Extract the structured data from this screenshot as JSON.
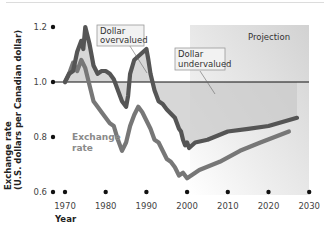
{
  "chart_data": {
    "type": "line",
    "title": "",
    "xlabel": "Year",
    "ylabel": "Exchange rate (U.S. dollars per Canadian dollar)",
    "xlim": [
      1967,
      2030
    ],
    "ylim": [
      0.6,
      1.2
    ],
    "x_ticks": [
      "1970",
      "1980",
      "1990",
      "2000",
      "2010",
      "2020",
      "2030"
    ],
    "y_ticks": [
      "0.6",
      "0.8",
      "1.0",
      "1.2"
    ],
    "reference_line": {
      "y": 1.0
    },
    "projection_region": {
      "label": "Projection",
      "x_start": 2000,
      "x_end": 2030
    },
    "annotations": [
      {
        "text_line1": "Dollar",
        "text_line2": "overvalued"
      },
      {
        "text_line1": "Dollar",
        "text_line2": "undervalued"
      }
    ],
    "series": [
      {
        "name": "Target / equilibrium path (dark line)",
        "color": "#555555",
        "points": [
          [
            1970,
            1.0
          ],
          [
            1971,
            1.03
          ],
          [
            1972,
            1.04
          ],
          [
            1973,
            1.11
          ],
          [
            1974,
            1.15
          ],
          [
            1974.5,
            1.12
          ],
          [
            1975,
            1.2
          ],
          [
            1976,
            1.14
          ],
          [
            1977,
            1.06
          ],
          [
            1978,
            1.03
          ],
          [
            1979,
            1.04
          ],
          [
            1980,
            1.04
          ],
          [
            1981,
            1.03
          ],
          [
            1982,
            1.01
          ],
          [
            1983,
            0.97
          ],
          [
            1984,
            0.93
          ],
          [
            1985,
            0.91
          ],
          [
            1985.5,
            0.95
          ],
          [
            1986,
            1.03
          ],
          [
            1987,
            1.08
          ],
          [
            1988.5,
            1.1
          ],
          [
            1990,
            1.12
          ],
          [
            1990.5,
            1.08
          ],
          [
            1991,
            1.03
          ],
          [
            1992,
            0.97
          ],
          [
            1993,
            0.93
          ],
          [
            1994,
            0.92
          ],
          [
            1995,
            0.9
          ],
          [
            1997,
            0.87
          ],
          [
            1998,
            0.83
          ],
          [
            1998.5,
            0.82
          ],
          [
            1999,
            0.79
          ],
          [
            1999.5,
            0.77
          ],
          [
            2000,
            0.78
          ],
          [
            2000.5,
            0.76
          ],
          [
            2002,
            0.78
          ],
          [
            2005,
            0.79
          ],
          [
            2010,
            0.82
          ],
          [
            2015,
            0.83
          ],
          [
            2020,
            0.84
          ],
          [
            2027,
            0.87
          ]
        ]
      },
      {
        "name": "Exchange rate",
        "color": "#777777",
        "points": [
          [
            1970,
            1.0
          ],
          [
            1971,
            1.03
          ],
          [
            1972,
            1.07
          ],
          [
            1973,
            1.04
          ],
          [
            1974,
            1.08
          ],
          [
            1975,
            1.05
          ],
          [
            1976,
            0.99
          ],
          [
            1977,
            0.93
          ],
          [
            1978,
            0.91
          ],
          [
            1979,
            0.89
          ],
          [
            1980,
            0.87
          ],
          [
            1981,
            0.85
          ],
          [
            1982,
            0.84
          ],
          [
            1983,
            0.79
          ],
          [
            1984,
            0.75
          ],
          [
            1985,
            0.78
          ],
          [
            1986,
            0.84
          ],
          [
            1987,
            0.88
          ],
          [
            1988,
            0.91
          ],
          [
            1989,
            0.89
          ],
          [
            1990,
            0.86
          ],
          [
            1991,
            0.83
          ],
          [
            1992,
            0.79
          ],
          [
            1993,
            0.78
          ],
          [
            1994,
            0.75
          ],
          [
            1995,
            0.72
          ],
          [
            1996,
            0.71
          ],
          [
            1997,
            0.69
          ],
          [
            1998,
            0.66
          ],
          [
            1999,
            0.67
          ],
          [
            2000,
            0.65
          ],
          [
            2003,
            0.68
          ],
          [
            2008,
            0.71
          ],
          [
            2013,
            0.75
          ],
          [
            2018,
            0.78
          ],
          [
            2025,
            0.82
          ]
        ]
      }
    ],
    "series_label": {
      "text_line1": "Exchange",
      "text_line2": "rate"
    }
  }
}
